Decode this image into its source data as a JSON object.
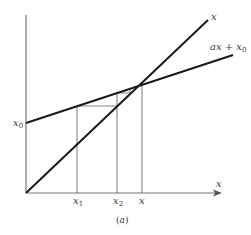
{
  "figure": {
    "caption_prefix": "(",
    "caption_letter": "a",
    "caption_suffix": ")",
    "colors": {
      "thick_line": "#1a1a1a",
      "thin_line": "#555555",
      "axis": "#777777",
      "text": "#3a3a3a"
    }
  },
  "labels": {
    "line_identity": "x",
    "line_affine_main": "ax + x",
    "line_affine_sub": "0",
    "y_intercept_main": "x",
    "y_intercept_sub": "0",
    "x_axis": "x",
    "tick_x1_main": "x",
    "tick_x1_sub": "1",
    "tick_x2_main": "x",
    "tick_x2_sub": "2",
    "tick_fixed": "x"
  },
  "geometry": {
    "origin": [
      26,
      193
    ],
    "y_axis_top": [
      26,
      15
    ],
    "x_axis_end": [
      222,
      193
    ],
    "identity_line": {
      "from": [
        26,
        193
      ],
      "to": [
        208,
        20
      ]
    },
    "affine_line": {
      "from": [
        26,
        123
      ],
      "to": [
        233,
        55
      ]
    },
    "fixed_point": [
      142,
      83
    ],
    "x1": 77,
    "x2": 117,
    "cobweb": [
      [
        77,
        193
      ],
      [
        77,
        106
      ],
      [
        117,
        106
      ],
      [
        117,
        93
      ],
      [
        130,
        93
      ],
      [
        130,
        88
      ]
    ]
  }
}
